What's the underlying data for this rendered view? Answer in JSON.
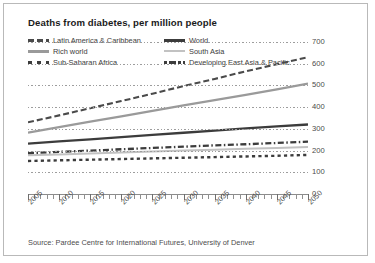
{
  "title": "Deaths from diabetes, per million people",
  "source": "Source: Pardee Centre for International Futures, University of Denver",
  "legend": [
    {
      "label": "Latin America & Caribbean",
      "style": "dash-dark",
      "col": 0,
      "row": 0
    },
    {
      "label": "Rich world",
      "style": "solid-gray",
      "col": 0,
      "row": 1
    },
    {
      "label": "Sub-Saharan Africa",
      "style": "dot-dark",
      "col": 0,
      "row": 2
    },
    {
      "label": "World",
      "style": "solid-dark",
      "col": 1,
      "row": 0
    },
    {
      "label": "South Asia",
      "style": "solid-lightgray",
      "col": 1,
      "row": 1
    },
    {
      "label": "Developing East Asia & Pacific",
      "style": "dashdot-dark",
      "col": 1,
      "row": 2
    }
  ],
  "chart_data": {
    "type": "line",
    "title": "Deaths from diabetes, per million people",
    "xlabel": "",
    "ylabel": "",
    "xlim": [
      2005,
      2050
    ],
    "ylim": [
      0,
      700
    ],
    "yticks": [
      0,
      100,
      200,
      300,
      400,
      500,
      600,
      700
    ],
    "xticks": [
      2005,
      2010,
      2015,
      2020,
      2025,
      2030,
      2035,
      2040,
      2045,
      2050
    ],
    "grid": true,
    "legend_position": "top",
    "x": [
      2005,
      2010,
      2015,
      2020,
      2025,
      2030,
      2035,
      2040,
      2045,
      2050
    ],
    "series": [
      {
        "name": "Latin America & Caribbean",
        "style": "dash-dark",
        "color": "#4a4a4a",
        "values": [
          330,
          362,
          395,
          428,
          462,
          497,
          530,
          565,
          598,
          630
        ]
      },
      {
        "name": "Rich world",
        "style": "solid-gray",
        "color": "#9a9a9a",
        "values": [
          283,
          308,
          333,
          358,
          383,
          408,
          432,
          456,
          482,
          508
        ]
      },
      {
        "name": "World",
        "style": "solid-dark",
        "color": "#3c3c3c",
        "values": [
          232,
          242,
          252,
          262,
          272,
          282,
          292,
          302,
          311,
          320
        ]
      },
      {
        "name": "Developing East Asia & Pacific",
        "style": "dashdot-dark",
        "color": "#3c3c3c",
        "values": [
          188,
          194,
          200,
          206,
          212,
          218,
          224,
          229,
          235,
          241
        ]
      },
      {
        "name": "South Asia",
        "style": "solid-lightgray",
        "color": "#c2c2c2",
        "values": [
          178,
          182,
          187,
          191,
          196,
          200,
          204,
          208,
          212,
          216
        ]
      },
      {
        "name": "Sub-Saharan Africa",
        "style": "dot-dark",
        "color": "#3c3c3c",
        "values": [
          152,
          155,
          158,
          161,
          164,
          167,
          170,
          173,
          176,
          180
        ]
      }
    ]
  }
}
